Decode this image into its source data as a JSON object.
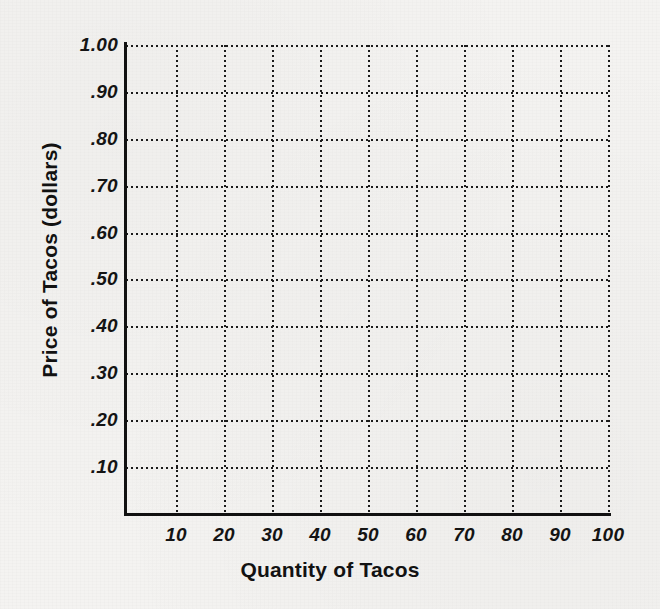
{
  "chart_data": {
    "type": "line",
    "title": "",
    "xlabel": "Quantity of Tacos",
    "ylabel": "Price of Tacos (dollars)",
    "xlim": [
      0,
      100
    ],
    "ylim": [
      0,
      1.0
    ],
    "grid": true,
    "grid_style": "dotted",
    "legend": "none",
    "series": [],
    "x_ticks": [
      {
        "value": 10,
        "label": "10"
      },
      {
        "value": 20,
        "label": "20"
      },
      {
        "value": 30,
        "label": "30"
      },
      {
        "value": 40,
        "label": "40"
      },
      {
        "value": 50,
        "label": "50"
      },
      {
        "value": 60,
        "label": "60"
      },
      {
        "value": 70,
        "label": "70"
      },
      {
        "value": 80,
        "label": "80"
      },
      {
        "value": 90,
        "label": "90"
      },
      {
        "value": 100,
        "label": "100"
      }
    ],
    "y_ticks": [
      {
        "value": 0.1,
        "label": ".10"
      },
      {
        "value": 0.2,
        "label": ".20"
      },
      {
        "value": 0.3,
        "label": ".30"
      },
      {
        "value": 0.4,
        "label": ".40"
      },
      {
        "value": 0.5,
        "label": ".50"
      },
      {
        "value": 0.6,
        "label": ".60"
      },
      {
        "value": 0.7,
        "label": ".70"
      },
      {
        "value": 0.8,
        "label": ".80"
      },
      {
        "value": 0.9,
        "label": ".90"
      },
      {
        "value": 1.0,
        "label": "1.00"
      }
    ]
  },
  "colors": {
    "background": "#f4f3f1",
    "ink": "#141414",
    "grid": "#1a1a1a"
  }
}
